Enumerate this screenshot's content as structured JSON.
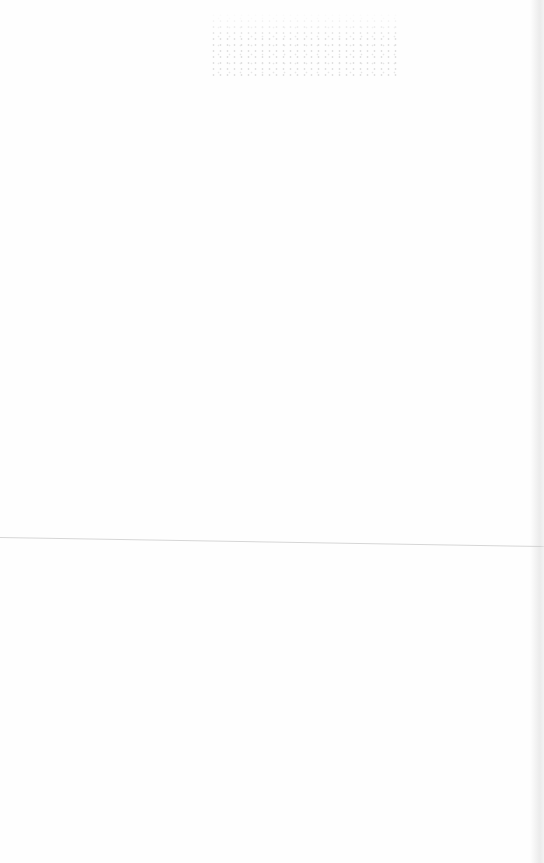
{
  "document": {
    "type": "scanned-page",
    "content_visible": false,
    "bleed_through_text": "",
    "colors": {
      "paper": "#fefefe",
      "fold_line": "#d6d6d6",
      "speckle": "#c9c9c9"
    }
  }
}
